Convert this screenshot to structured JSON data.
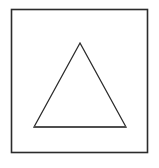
{
  "canvas": {
    "width": 159,
    "height": 168,
    "background_color": "#ffffff"
  },
  "figure": {
    "shapes": [
      {
        "name": "square-frame",
        "type": "rectangle",
        "x": 11.5,
        "y": 9.5,
        "width": 136,
        "height": 143,
        "stroke_color": "#2b2b2b",
        "stroke_width": 1.6,
        "fill": "none"
      },
      {
        "name": "triangle",
        "type": "polygon",
        "points": "80,43 126,127 34,127",
        "apex": {
          "x": 80,
          "y": 43
        },
        "bottom_left": {
          "x": 34,
          "y": 127
        },
        "bottom_right": {
          "x": 126,
          "y": 127
        },
        "stroke_color": "#2b2b2b",
        "stroke_width": 1.3,
        "fill": "none"
      },
      {
        "name": "triangle-base-line",
        "type": "line",
        "x1": 34,
        "y1": 127,
        "x2": 126,
        "y2": 127,
        "stroke_color": "#4f4f4f",
        "stroke_width": 1.8
      }
    ]
  }
}
